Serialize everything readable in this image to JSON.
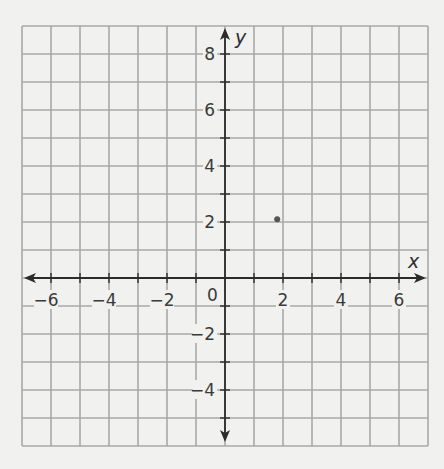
{
  "chart_data": {
    "type": "scatter",
    "title": "",
    "xlabel": "x",
    "ylabel": "y",
    "xlim": [
      -7,
      7
    ],
    "ylim": [
      -6,
      9
    ],
    "grid": true,
    "grid_step": 1,
    "x_ticks": [
      -6,
      -5,
      -4,
      -3,
      -2,
      -1,
      1,
      2,
      3,
      4,
      5,
      6
    ],
    "y_ticks": [
      -5,
      -4,
      -3,
      -2,
      -1,
      1,
      2,
      3,
      4,
      5,
      6,
      7,
      8
    ],
    "x_tick_labels": [
      "-6",
      "-4",
      "-2",
      "2",
      "4",
      "6"
    ],
    "x_tick_label_values": [
      -6,
      -4,
      -2,
      2,
      4,
      6
    ],
    "y_tick_labels": [
      "8",
      "6",
      "4",
      "2",
      "-2",
      "-4"
    ],
    "y_tick_label_values": [
      8,
      6,
      4,
      2,
      -2,
      -4
    ],
    "origin_label": "0",
    "points": [
      {
        "x": 1.8,
        "y": 2.1
      }
    ],
    "legend": null
  },
  "labels": {
    "x_axis": "x",
    "y_axis": "y",
    "origin": "0"
  },
  "colors": {
    "background": "#f1f1ef",
    "grid": "#a9a9a7",
    "axis": "#2b2b2b",
    "point": "#555555"
  }
}
